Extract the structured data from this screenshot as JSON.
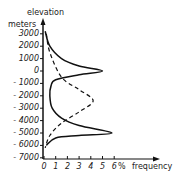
{
  "chart_data": {
    "type": "line",
    "title": "",
    "ylabel_top": "elevation",
    "ylabel_unit": "meters",
    "xlabel": "frequency",
    "xunit": "%",
    "xticks": [
      "0",
      "1",
      "2",
      "3",
      "4",
      "5",
      "6"
    ],
    "yticks": [
      "3000",
      "2000",
      "1000",
      "0",
      "- 1000",
      "- 2000",
      "- 3000",
      "- 4000",
      "- 5000",
      "- 6000",
      "- 7000"
    ],
    "xlim": [
      0,
      6
    ],
    "ylim": [
      -7000,
      3500
    ],
    "series": [
      {
        "name": "solid curve (hypsometric frequency)",
        "style": "solid",
        "points": [
          [
            0.1,
            3200
          ],
          [
            0.5,
            2000
          ],
          [
            1.5,
            1000
          ],
          [
            3,
            400
          ],
          [
            5,
            0
          ],
          [
            3,
            -300
          ],
          [
            1,
            -700
          ],
          [
            0.6,
            -1200
          ],
          [
            0.5,
            -2000
          ],
          [
            0.7,
            -3000
          ],
          [
            1.5,
            -3800
          ],
          [
            3,
            -4400
          ],
          [
            5.8,
            -5000
          ],
          [
            3,
            -5200
          ],
          [
            1,
            -5400
          ],
          [
            0.2,
            -6000
          ]
        ]
      },
      {
        "name": "dashed curve (normal distribution)",
        "style": "dashed",
        "points": [
          [
            0.2,
            3000
          ],
          [
            0.5,
            1500
          ],
          [
            1.5,
            -500
          ],
          [
            3,
            -1500
          ],
          [
            4.2,
            -2400
          ],
          [
            3,
            -3300
          ],
          [
            1.5,
            -4200
          ],
          [
            0.5,
            -5200
          ],
          [
            0.1,
            -6200
          ]
        ]
      }
    ]
  }
}
